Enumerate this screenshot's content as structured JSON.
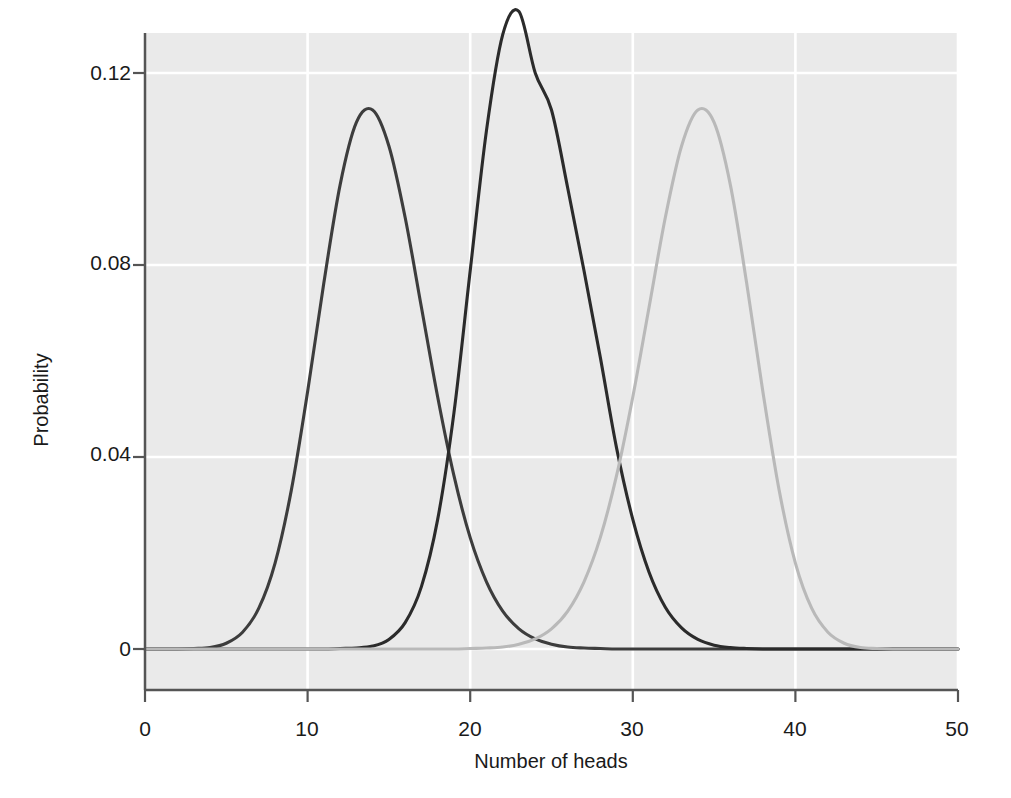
{
  "figure": {
    "background": "#ffffff",
    "plot_background": "#eaeaea",
    "gridline_color": "#ffffff",
    "axis_color": "#555555"
  },
  "axis": {
    "x_title": "Number of heads",
    "y_title": "Probability",
    "x_ticks": [
      "0",
      "10",
      "20",
      "30",
      "40",
      "50"
    ],
    "y_ticks": [
      "0",
      "0.04",
      "0.08",
      "0.12"
    ]
  },
  "chart_data": {
    "type": "line",
    "title": "",
    "subtitle": "",
    "xlabel": "Number of heads",
    "ylabel": "Probability",
    "xlim": [
      0,
      50
    ],
    "ylim": [
      0,
      0.1295
    ],
    "xticks": [
      0,
      10,
      20,
      30,
      40,
      50
    ],
    "yticks": [
      0,
      0.04,
      0.08,
      0.12
    ],
    "grid": true,
    "legend": "none",
    "series": [
      {
        "name": "p = 0.3",
        "color": "#3d3d3d",
        "n": 50,
        "p": 0.3,
        "mean": 15,
        "peak_x": 15,
        "peak_y": 0.1223,
        "x": [
          0,
          1,
          2,
          3,
          4,
          5,
          6,
          7,
          8,
          9,
          10,
          11,
          12,
          13,
          14,
          15,
          16,
          17,
          18,
          19,
          20,
          21,
          22,
          23,
          24,
          25,
          26,
          27,
          28,
          29,
          30,
          31,
          32,
          33,
          34,
          35,
          36,
          37,
          38,
          39,
          40,
          41,
          42,
          43,
          44,
          45,
          46,
          47,
          48,
          49,
          50
        ],
        "values": [
          0.0,
          0.0,
          0.0,
          0.0001,
          0.0003,
          0.0012,
          0.0035,
          0.0085,
          0.0179,
          0.0331,
          0.0536,
          0.0763,
          0.0967,
          0.1097,
          0.1123,
          0.1048,
          0.0899,
          0.0712,
          0.0525,
          0.0361,
          0.0232,
          0.014,
          0.0079,
          0.0042,
          0.0021,
          0.001,
          0.0004,
          0.0002,
          0.0001,
          0.0,
          0.0,
          0.0,
          0.0,
          0.0,
          0.0,
          0.0,
          0.0,
          0.0,
          0.0,
          0.0,
          0.0,
          0.0,
          0.0,
          0.0,
          0.0,
          0.0,
          0.0,
          0.0,
          0.0,
          0.0,
          0.0
        ]
      },
      {
        "name": "p = 0.5",
        "color": "#2b2b2b",
        "n": 50,
        "p": 0.5,
        "mean": 25,
        "peak_x": 25,
        "peak_y": 0.1123,
        "x": [
          0,
          1,
          2,
          3,
          4,
          5,
          6,
          7,
          8,
          9,
          10,
          11,
          12,
          13,
          14,
          15,
          16,
          17,
          18,
          19,
          20,
          21,
          22,
          23,
          24,
          25,
          26,
          27,
          28,
          29,
          30,
          31,
          32,
          33,
          34,
          35,
          36,
          37,
          38,
          39,
          40,
          41,
          42,
          43,
          44,
          45,
          46,
          47,
          48,
          49,
          50
        ],
        "values": [
          0.0,
          0.0,
          0.0,
          0.0,
          0.0,
          0.0,
          0.0,
          0.0,
          0.0,
          0.0,
          0.0,
          0.0,
          0.0001,
          0.0002,
          0.0006,
          0.002,
          0.0055,
          0.013,
          0.027,
          0.0492,
          0.0788,
          0.108,
          0.128,
          0.1328,
          0.12,
          0.1123,
          0.096,
          0.0788,
          0.0608,
          0.0419,
          0.027,
          0.016,
          0.0087,
          0.0044,
          0.002,
          0.0008,
          0.0003,
          0.0001,
          0.0,
          0.0,
          0.0,
          0.0,
          0.0,
          0.0,
          0.0,
          0.0,
          0.0,
          0.0,
          0.0,
          0.0,
          0.0
        ]
      },
      {
        "name": "p = 0.7",
        "color": "#b9b9b9",
        "n": 50,
        "p": 0.7,
        "mean": 35,
        "peak_x": 35,
        "peak_y": 0.1223,
        "x": [
          0,
          1,
          2,
          3,
          4,
          5,
          6,
          7,
          8,
          9,
          10,
          11,
          12,
          13,
          14,
          15,
          16,
          17,
          18,
          19,
          20,
          21,
          22,
          23,
          24,
          25,
          26,
          27,
          28,
          29,
          30,
          31,
          32,
          33,
          34,
          35,
          36,
          37,
          38,
          39,
          40,
          41,
          42,
          43,
          44,
          45,
          46,
          47,
          48,
          49,
          50
        ],
        "values": [
          0.0,
          0.0,
          0.0,
          0.0,
          0.0,
          0.0,
          0.0,
          0.0,
          0.0,
          0.0,
          0.0,
          0.0,
          0.0,
          0.0,
          0.0,
          0.0,
          0.0,
          0.0,
          0.0,
          0.0,
          0.0001,
          0.0002,
          0.0004,
          0.001,
          0.0021,
          0.0042,
          0.0079,
          0.014,
          0.0232,
          0.0361,
          0.0525,
          0.0712,
          0.0899,
          0.1048,
          0.1123,
          0.1097,
          0.0967,
          0.0763,
          0.0536,
          0.0331,
          0.0179,
          0.0085,
          0.0035,
          0.0012,
          0.0003,
          0.0001,
          0.0,
          0.0,
          0.0,
          0.0,
          0.0
        ]
      }
    ]
  }
}
